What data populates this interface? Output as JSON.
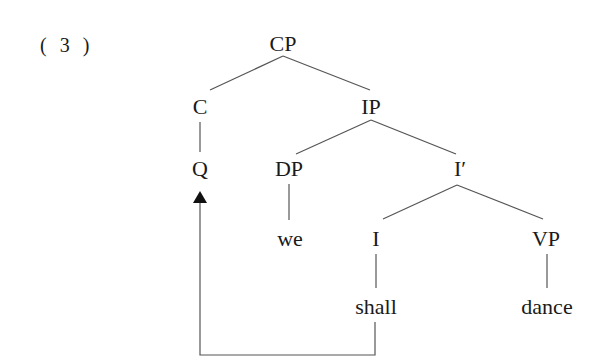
{
  "example_number": "( 3 )",
  "tree": {
    "nodes": [
      {
        "id": "CP",
        "label": "CP",
        "x": 283,
        "y": 44
      },
      {
        "id": "C",
        "label": "C",
        "x": 200,
        "y": 107
      },
      {
        "id": "IP",
        "label": "IP",
        "x": 371,
        "y": 107
      },
      {
        "id": "Q",
        "label": "Q",
        "x": 200,
        "y": 169
      },
      {
        "id": "DP",
        "label": "DP",
        "x": 289,
        "y": 169
      },
      {
        "id": "Ibar",
        "label": "I′",
        "x": 458,
        "y": 169
      },
      {
        "id": "we",
        "label": "we",
        "x": 290,
        "y": 239
      },
      {
        "id": "I",
        "label": "I",
        "x": 376,
        "y": 239
      },
      {
        "id": "VP",
        "label": "VP",
        "x": 546,
        "y": 239
      },
      {
        "id": "shall",
        "label": "shall",
        "x": 376,
        "y": 307
      },
      {
        "id": "dance",
        "label": "dance",
        "x": 547,
        "y": 307
      }
    ],
    "edges": [
      [
        "CP",
        "C"
      ],
      [
        "CP",
        "IP"
      ],
      [
        "C",
        "Q"
      ],
      [
        "IP",
        "DP"
      ],
      [
        "IP",
        "Ibar"
      ],
      [
        "DP",
        "we"
      ],
      [
        "Ibar",
        "I"
      ],
      [
        "Ibar",
        "VP"
      ],
      [
        "I",
        "shall"
      ],
      [
        "VP",
        "dance"
      ]
    ],
    "movement_arrow": {
      "from": "shall",
      "to": "Q"
    }
  }
}
